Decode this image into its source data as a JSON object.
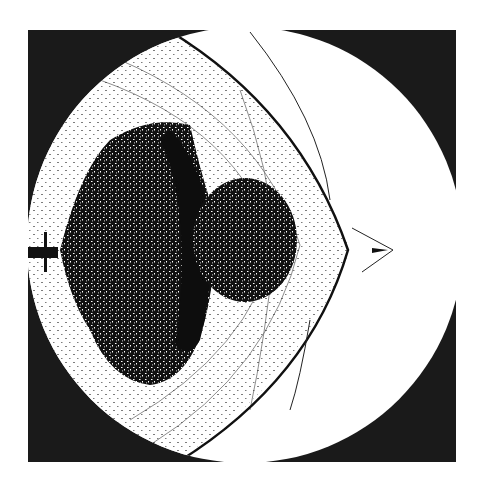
{
  "image": {
    "description": "Shadowgraph of a projectile exiting a muzzle with expanding blast cloud and shock waves",
    "colors": {
      "background": "#ffffff",
      "frame": "#1a1a1a",
      "field": "#ffffff",
      "cloud": "#111111",
      "shock": "#1a1a1a"
    },
    "frame": {
      "x": 28,
      "y": 30,
      "width": 428,
      "height": 432
    },
    "field_circle": {
      "cx": 245,
      "cy": 245,
      "r": 218
    },
    "muzzle": {
      "x": 28,
      "y": 253
    },
    "projectile": {
      "x": 380,
      "y": 250
    }
  }
}
